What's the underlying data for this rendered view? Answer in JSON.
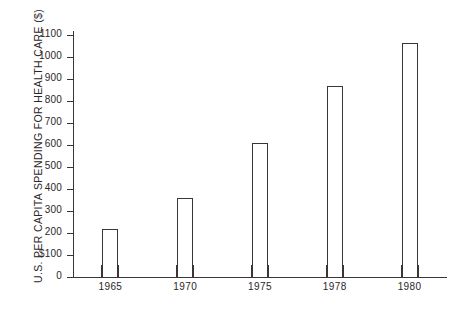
{
  "chart_data": {
    "type": "bar",
    "title": "",
    "subtitle": "",
    "xlabel": "",
    "ylabel": "U.S. PER CAPITA SPENDING FOR HEALTH CARE ($)",
    "categories": [
      "1965",
      "1970",
      "1975",
      "1978",
      "1980"
    ],
    "values": [
      220,
      360,
      610,
      870,
      1065
    ],
    "series": [
      {
        "name": "U.S. per capita spending for health care",
        "values": [
          220,
          360,
          610,
          870,
          1065
        ]
      }
    ],
    "ylim": [
      0,
      1100
    ],
    "ytick_values": [
      0,
      100,
      200,
      300,
      400,
      500,
      600,
      700,
      800,
      900,
      1000,
      1100
    ],
    "ytick_labels": [
      "0",
      "100",
      "200",
      "300",
      "400",
      "500",
      "600",
      "700",
      "800",
      "900",
      "1000",
      "1100"
    ],
    "currency_symbol": "$",
    "currency_symbol_at_tick": "100",
    "grid": false,
    "legend": false,
    "legend_position": "none",
    "bar_style": "outlined-hollow",
    "bar_outline_color": "#3a3637",
    "bar_fill_color": "#ffffff",
    "axis_color": "#3a3637",
    "background_color": "#ffffff",
    "annotations": []
  },
  "axes": {
    "y_title": "U.S. PER CAPITA SPENDING FOR HEALTH CARE ($)"
  }
}
